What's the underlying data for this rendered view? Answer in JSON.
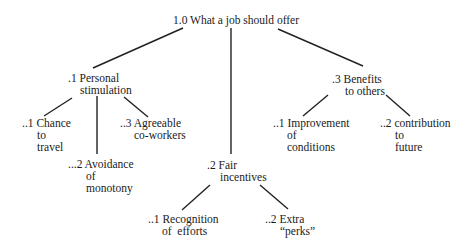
{
  "diagram": {
    "type": "tree",
    "root": {
      "id": "1.0",
      "label": "1.0 What a job should offer",
      "children": [
        {
          "id": ".1",
          "lines": [
            ".1 Personal",
            "stimulation"
          ],
          "children": [
            {
              "id": "..1",
              "lines": [
                "..1 Chance",
                "to",
                "travel"
              ]
            },
            {
              "id": "...2",
              "lines": [
                "...2 Avoidance",
                "of",
                "monotony"
              ]
            },
            {
              "id": "..3",
              "lines": [
                "..3 Agreeable",
                "co-workers"
              ]
            }
          ]
        },
        {
          "id": ".2",
          "lines": [
            ".2 Fair",
            "incentives"
          ],
          "children": [
            {
              "id": "..1",
              "lines": [
                "..1 Recognition",
                "of  efforts"
              ]
            },
            {
              "id": "..2",
              "lines": [
                "..2 Extra",
                "“perks”"
              ]
            }
          ]
        },
        {
          "id": ".3",
          "lines": [
            ".3 Benefits",
            "to others"
          ],
          "children": [
            {
              "id": "..1",
              "lines": [
                "..1 Improvement",
                "of",
                "conditions"
              ]
            },
            {
              "id": "..2",
              "lines": [
                "..2 contribution",
                "to",
                "future"
              ]
            }
          ]
        }
      ]
    }
  }
}
